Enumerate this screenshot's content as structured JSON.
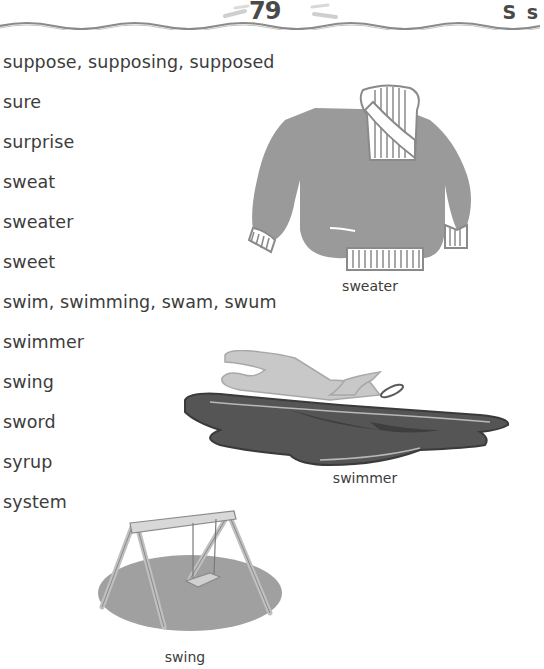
{
  "header": {
    "page_number": "79",
    "letter": "S s"
  },
  "word_list": [
    "suppose, supposing, supposed",
    "sure",
    "surprise",
    "sweat",
    "sweater",
    "sweet",
    "swim, swimming, swam, swum",
    "swimmer",
    "swing",
    "sword",
    "syrup",
    "system"
  ],
  "illustrations": {
    "sweater": {
      "caption": "sweater",
      "icon": "sweater-icon"
    },
    "swimmer": {
      "caption": "swimmer",
      "icon": "swimmer-icon"
    },
    "swing": {
      "caption": "swing",
      "icon": "swing-icon"
    }
  },
  "colors": {
    "text": "#3c3c3c",
    "sweater_fill": "#999999",
    "water_fill": "#555555",
    "swimmer_fill": "#c8c8c8",
    "swing_ground": "#a0a0a0"
  }
}
